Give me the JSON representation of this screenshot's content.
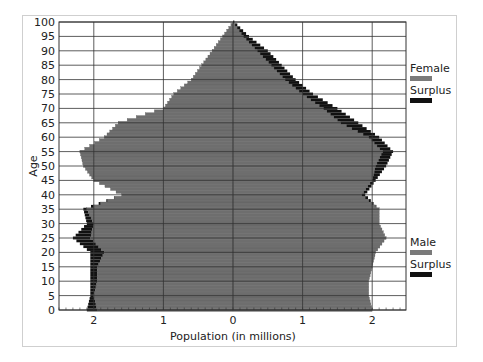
{
  "chart_data": {
    "type": "bar",
    "orientation": "horizontal",
    "title": "",
    "xlabel": "Population (in millions)",
    "ylabel": "Age",
    "x_ticks": [
      "2",
      "1",
      "0",
      "1",
      "2"
    ],
    "y_ticks": [
      "0",
      "5",
      "10",
      "15",
      "20",
      "25",
      "30",
      "35",
      "40",
      "45",
      "50",
      "55",
      "60",
      "65",
      "70",
      "75",
      "80",
      "85",
      "90",
      "95",
      "100"
    ],
    "xlim": [
      -2.5,
      2.5
    ],
    "ylim": [
      0,
      100
    ],
    "grid": true,
    "legend": [
      {
        "label": "Female",
        "color": "#7a7a7a",
        "position": "upper-right"
      },
      {
        "label": "Surplus",
        "color": "#111111",
        "position": "upper-right"
      },
      {
        "label": "Male",
        "color": "#7a7a7a",
        "position": "lower-right"
      },
      {
        "label": "Surplus",
        "color": "#111111",
        "position": "lower-right"
      }
    ],
    "colors": {
      "base": "#6e6e6e",
      "surplus": "#111111",
      "grid": "#333333"
    },
    "categories": [
      0,
      5,
      10,
      15,
      20,
      25,
      30,
      35,
      40,
      45,
      50,
      55,
      60,
      65,
      70,
      75,
      80,
      85,
      90,
      95,
      100
    ],
    "series": [
      {
        "name": "Male",
        "side": "left",
        "values": [
          1.95,
          2.0,
          1.95,
          1.95,
          1.85,
          2.05,
          2.0,
          2.1,
          1.6,
          2.0,
          2.15,
          2.2,
          1.85,
          1.65,
          1.0,
          0.85,
          0.6,
          0.45,
          0.3,
          0.15,
          0.0
        ]
      },
      {
        "name": "Male Surplus",
        "side": "left",
        "values": [
          0.15,
          0.05,
          0.1,
          0.1,
          0.2,
          0.25,
          0.1,
          0.05,
          0,
          0,
          0,
          0,
          0,
          0,
          0,
          0,
          0,
          0,
          0,
          0,
          0
        ]
      },
      {
        "name": "Female",
        "side": "right",
        "values": [
          2.0,
          1.95,
          1.95,
          2.0,
          2.05,
          2.2,
          2.1,
          2.1,
          1.85,
          2.0,
          2.05,
          2.15,
          1.95,
          1.55,
          1.3,
          1.0,
          0.75,
          0.55,
          0.35,
          0.15,
          0.0
        ]
      },
      {
        "name": "Female Surplus",
        "side": "right",
        "values": [
          0,
          0,
          0,
          0,
          0,
          0,
          0,
          0,
          0.05,
          0.05,
          0.15,
          0.15,
          0.15,
          0.25,
          0.2,
          0.15,
          0.15,
          0.15,
          0.15,
          0.08,
          0.02
        ]
      }
    ]
  }
}
